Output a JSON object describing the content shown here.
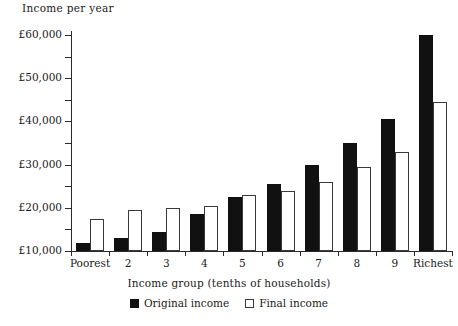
{
  "chart_data": {
    "type": "bar",
    "title": "",
    "ylabel": "Income per year",
    "xlabel": "Income group (tenths of households)",
    "categories": [
      "Poorest",
      "2",
      "3",
      "4",
      "5",
      "6",
      "7",
      "8",
      "9",
      "Richest"
    ],
    "series": [
      {
        "name": "Original income",
        "color": "#111111",
        "values": [
          11800,
          13000,
          14500,
          18500,
          22500,
          25500,
          30000,
          35000,
          40500,
          60000
        ]
      },
      {
        "name": "Final income",
        "color": "#ffffff",
        "values": [
          17500,
          19500,
          20000,
          20500,
          23000,
          24000,
          26000,
          29500,
          33000,
          44500
        ]
      }
    ],
    "ylim": [
      10000,
      60000
    ],
    "ytick_values": [
      10000,
      15000,
      20000,
      25000,
      30000,
      35000,
      40000,
      45000,
      50000,
      55000,
      60000
    ],
    "ytick_labels": [
      "£10,000",
      "",
      "£20,000",
      "",
      "£30,000",
      "",
      "£40,000",
      "",
      "£50,000",
      "",
      "£60,000"
    ],
    "grid": false,
    "legend_position": "bottom"
  }
}
